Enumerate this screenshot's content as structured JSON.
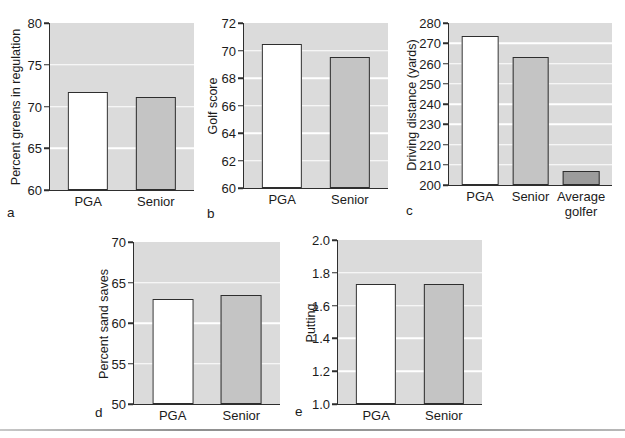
{
  "colors": {
    "plot_bg": "#dbdbdb",
    "gridline": "#ffffff",
    "axis": "#2e2e2e",
    "bar_border": "#2e2e2e",
    "pga_fill": "#ffffff",
    "senior_fill": "#c4c4c4",
    "average_golfer_fill": "#9c9c9c",
    "bottom_rule": "#9a9a9a"
  },
  "chart_data": [
    {
      "type": "bar",
      "panel": "a",
      "ylabel": "Percent greens in regulation",
      "xlabel": "",
      "categories": [
        "PGA",
        "Senior"
      ],
      "values": [
        71.7,
        71.1
      ],
      "yticks": [
        "80",
        "75",
        "70",
        "65",
        "60"
      ],
      "ylim": [
        60,
        80
      ],
      "bar_colors": [
        "#ffffff",
        "#c4c4c4"
      ],
      "grid": "horizontal-white",
      "legend": "none"
    },
    {
      "type": "bar",
      "panel": "b",
      "ylabel": "Golf score",
      "xlabel": "",
      "categories": [
        "PGA",
        "Senior"
      ],
      "values": [
        70.5,
        69.5
      ],
      "yticks": [
        "72",
        "70",
        "68",
        "66",
        "64",
        "62",
        "60"
      ],
      "ylim": [
        60,
        72
      ],
      "bar_colors": [
        "#ffffff",
        "#c4c4c4"
      ],
      "grid": "horizontal-white",
      "legend": "none"
    },
    {
      "type": "bar",
      "panel": "c",
      "ylabel": "Driving distance (yards)",
      "xlabel": "",
      "categories": [
        "PGA",
        "Senior",
        "Average\ngolfer"
      ],
      "values": [
        273.5,
        263,
        207
      ],
      "yticks": [
        "280",
        "270",
        "260",
        "250",
        "240",
        "230",
        "220",
        "210",
        "200"
      ],
      "ylim": [
        200,
        280
      ],
      "bar_colors": [
        "#ffffff",
        "#c4c4c4",
        "#9c9c9c"
      ],
      "grid": "horizontal-white",
      "legend": "none"
    },
    {
      "type": "bar",
      "panel": "d",
      "ylabel": "Percent sand saves",
      "xlabel": "",
      "categories": [
        "PGA",
        "Senior"
      ],
      "values": [
        63.0,
        63.5
      ],
      "yticks": [
        "70",
        "65",
        "60",
        "55",
        "50"
      ],
      "ylim": [
        50,
        70
      ],
      "bar_colors": [
        "#ffffff",
        "#c4c4c4"
      ],
      "grid": "horizontal-white",
      "legend": "none"
    },
    {
      "type": "bar",
      "panel": "e",
      "ylabel": "Putting",
      "xlabel": "",
      "categories": [
        "PGA",
        "Senior"
      ],
      "values": [
        1.73,
        1.73
      ],
      "yticks": [
        "2.0",
        "1.8",
        "1.6",
        "1.4",
        "1.2",
        "1.0"
      ],
      "ylim": [
        1.0,
        2.0
      ],
      "bar_colors": [
        "#ffffff",
        "#c4c4c4"
      ],
      "grid": "horizontal-white",
      "legend": "none"
    }
  ]
}
